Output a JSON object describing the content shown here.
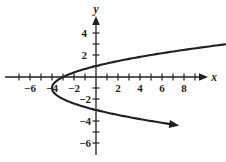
{
  "figure": {
    "background_color": "#ffffff",
    "ink_color": "#231f20"
  },
  "axes": {
    "x_axis_label": "x",
    "y_axis_label": "y",
    "origin_px": {
      "x": 96,
      "y": 77
    },
    "unit_px": 11,
    "x_axis_span_px": {
      "start": 5,
      "end": 208
    },
    "y_axis_span_px": {
      "start": 155,
      "end": 16
    },
    "x_ticks": [
      -7,
      -6,
      -5,
      -4,
      -3,
      -2,
      -1,
      1,
      2,
      3,
      4,
      5,
      6,
      7,
      8,
      9
    ],
    "y_ticks": [
      -6,
      -5,
      -4,
      -3,
      -2,
      -1,
      1,
      2,
      3,
      4,
      5
    ],
    "x_tick_labels": [
      {
        "value": -6,
        "text": "−6"
      },
      {
        "value": -4,
        "text": "−4"
      },
      {
        "value": -2,
        "text": "−2"
      },
      {
        "value": 2,
        "text": "2"
      },
      {
        "value": 4,
        "text": "4"
      },
      {
        "value": 6,
        "text": "6"
      },
      {
        "value": 8,
        "text": "8"
      }
    ],
    "y_tick_labels": [
      {
        "value": 4,
        "text": "4"
      },
      {
        "value": 2,
        "text": "2"
      },
      {
        "value": -2,
        "text": "−2"
      },
      {
        "value": -4,
        "text": "−4"
      },
      {
        "value": -6,
        "text": "−6"
      }
    ]
  },
  "chart_data": {
    "type": "line",
    "title": "",
    "xlabel": "x",
    "ylabel": "y",
    "xlim": [
      -8.3,
      10.2
    ],
    "ylim": [
      -5.6,
      5.5
    ],
    "grid": false,
    "legend": null,
    "curves": [
      {
        "name": "rightward-opening parabola",
        "equation": "x = (y + 1)^2 - 4",
        "vertex": [
          -4,
          -1
        ],
        "opens": "right",
        "x_intercepts": [
          -3
        ],
        "y_intercepts": [
          1,
          -3
        ],
        "arrowheads": [
          "upper-right",
          "lower-right"
        ],
        "upper_branch_points": [
          [
            -4,
            -1
          ],
          [
            -3.75,
            -0.5
          ],
          [
            -3,
            0
          ],
          [
            -2.4375,
            0.25
          ],
          [
            -1.75,
            0.5
          ],
          [
            -0.9375,
            0.75
          ],
          [
            0,
            1
          ],
          [
            1.25,
            1.5
          ],
          [
            2.0625,
            1.75
          ],
          [
            3,
            2
          ],
          [
            5.25,
            2.5
          ],
          [
            6.5625,
            2.75
          ],
          [
            8,
            3
          ],
          [
            9.5,
            3.25
          ]
        ],
        "lower_branch_points": [
          [
            -4,
            -1
          ],
          [
            -3.75,
            -1.5
          ],
          [
            -3,
            -2
          ],
          [
            -2.4375,
            -2.25
          ],
          [
            -1.75,
            -2.5
          ],
          [
            -0.9375,
            -2.75
          ],
          [
            0,
            -3
          ],
          [
            1.25,
            -3.5
          ],
          [
            2.0625,
            -3.75
          ],
          [
            3,
            -4
          ],
          [
            5.25,
            -4.5
          ],
          [
            6.5625,
            -4.75
          ],
          [
            8,
            -5
          ],
          [
            9.2,
            -5.15
          ]
        ]
      }
    ]
  }
}
